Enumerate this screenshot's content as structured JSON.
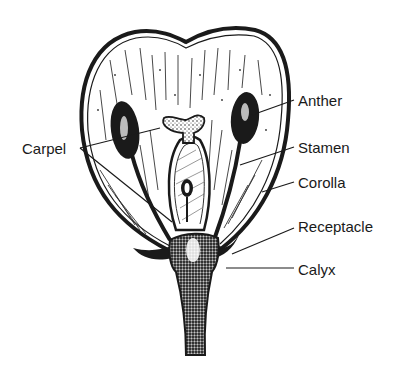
{
  "diagram": {
    "labels": [
      {
        "id": "anther",
        "text": "Anther",
        "x": 298,
        "y": 93
      },
      {
        "id": "stamen",
        "text": "Stamen",
        "x": 298,
        "y": 140
      },
      {
        "id": "corolla",
        "text": "Corolla",
        "x": 298,
        "y": 175
      },
      {
        "id": "receptacle",
        "text": "Receptacle",
        "x": 298,
        "y": 219
      },
      {
        "id": "calyx",
        "text": "Calyx",
        "x": 298,
        "y": 262
      },
      {
        "id": "carpel",
        "text": "Carpel",
        "x": 22,
        "y": 141
      }
    ],
    "colors": {
      "ink": "#1a1a1a",
      "paper": "#ffffff",
      "stipple": "#555555"
    }
  }
}
